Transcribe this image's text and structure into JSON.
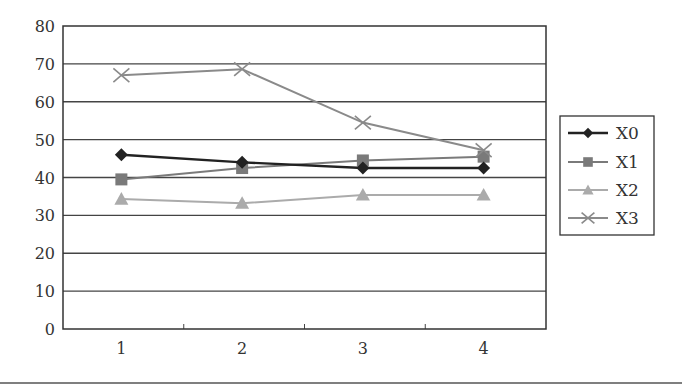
{
  "chart_data": {
    "type": "line",
    "title": "",
    "xlabel": "",
    "ylabel": "",
    "categories": [
      "1",
      "2",
      "3",
      "4"
    ],
    "ylim": [
      0,
      80
    ],
    "yticks": [
      0,
      10,
      20,
      30,
      40,
      50,
      60,
      70,
      80
    ],
    "grid": true,
    "legend_position": "right",
    "series": [
      {
        "name": "X0",
        "marker": "diamond",
        "color": "#222222",
        "values": [
          46,
          44,
          42.5,
          42.5
        ]
      },
      {
        "name": "X1",
        "marker": "square",
        "color": "#7a7a7a",
        "values": [
          39.5,
          42.5,
          44.5,
          45.5
        ]
      },
      {
        "name": "X2",
        "marker": "triangle",
        "color": "#ababab",
        "values": [
          34.3,
          33.2,
          35.4,
          35.4
        ]
      },
      {
        "name": "X3",
        "marker": "x",
        "color": "#8a8a8a",
        "values": [
          67,
          68.6,
          54.5,
          47.2
        ]
      }
    ]
  }
}
